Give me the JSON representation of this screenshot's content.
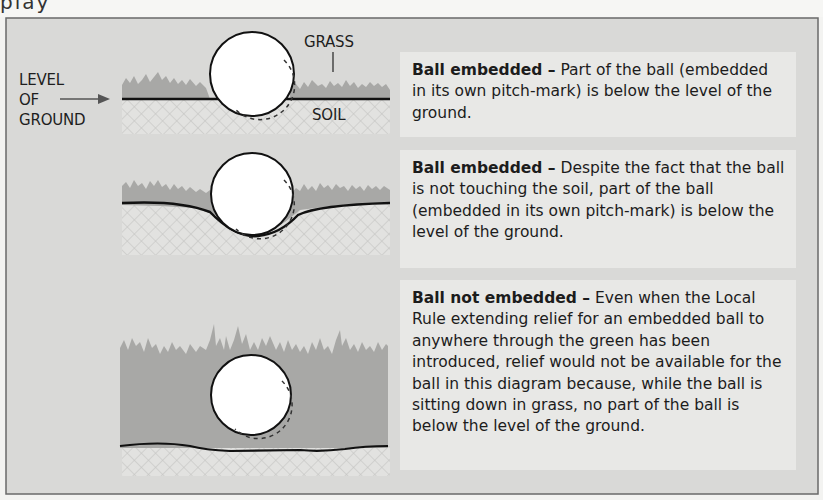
{
  "page": {
    "heading_fragment": "play"
  },
  "diagram": {
    "labels": {
      "level_of_ground": [
        "LEVEL",
        "OF",
        "GROUND"
      ],
      "grass": "GRASS",
      "soil": "SOIL"
    },
    "colors": {
      "panel_bg": "#d9d9d7",
      "textbox_bg": "#e8e8e6",
      "grass": "#a8a8a6",
      "soil_hatch": "#c8c8c6",
      "ground_line": "#111111",
      "ball": "#ffffff"
    },
    "cases": [
      {
        "title": "Ball embedded –",
        "body": " Part of the ball (embedded in its own pitch-mark) is below the level of the ground."
      },
      {
        "title": "Ball embedded –",
        "body": " Despite the fact that the ball is not touching the soil, part of the ball (embedded in its own pitch-mark) is below the level of the ground."
      },
      {
        "title": "Ball not embedded –",
        "body": " Even when the Local Rule extending relief for an embedded ball to anywhere through the green has been introduced, relief would not be available for the ball in this diagram because, while the ball is sitting down in grass, no part of the ball is below the level of the ground."
      }
    ]
  }
}
